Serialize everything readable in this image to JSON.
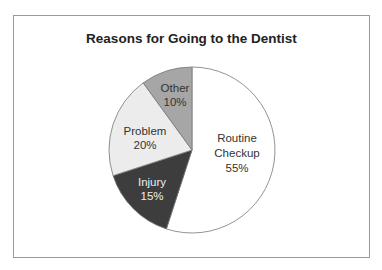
{
  "chart_data": {
    "type": "pie",
    "title": "Reasons for Going to the Dentist",
    "categories": [
      "Routine Checkup",
      "Injury",
      "Problem",
      "Other"
    ],
    "values": [
      55,
      15,
      20,
      10
    ],
    "unit": "%",
    "colors": [
      "#ffffff",
      "#3d3d3d",
      "#ececec",
      "#a6a6a6"
    ],
    "label_colors": [
      "#333333",
      "#eeeeee",
      "#333333",
      "#333333"
    ],
    "start_angle": "12 o'clock",
    "direction": "clockwise",
    "legend": "none (labels inside slices)"
  },
  "labels": {
    "routine_line1": "Routine",
    "routine_line2": "Checkup",
    "routine_pct": "55%",
    "injury_line1": "Injury",
    "injury_pct": "15%",
    "problem_line1": "Problem",
    "problem_pct": "20%",
    "other_line1": "Other",
    "other_pct": "10%"
  }
}
